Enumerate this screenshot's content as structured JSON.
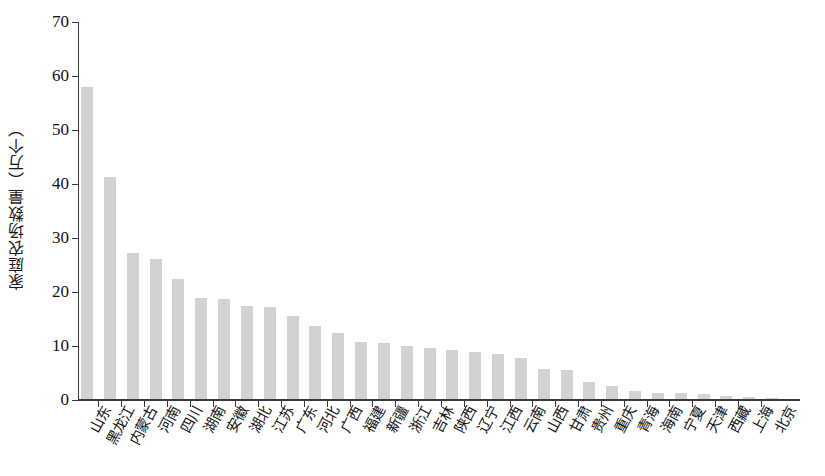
{
  "chart_data": {
    "type": "bar",
    "title": "",
    "xlabel": "",
    "ylabel": "家庭农场数量（万个）",
    "ylim": [
      0,
      70
    ],
    "ytick_step": 10,
    "ytick_labels": [
      "0",
      "10",
      "20",
      "30",
      "40",
      "50",
      "60",
      "70"
    ],
    "grid": false,
    "legend": null,
    "bar_color": "#d2d2d2",
    "axis_color": "#3a3a3a",
    "categories": [
      "山东",
      "黑龙江",
      "内蒙古",
      "河南",
      "四川",
      "湖南",
      "安徽",
      "湖北",
      "江苏",
      "广东",
      "河北",
      "广西",
      "福建",
      "新疆",
      "浙江",
      "吉林",
      "陕西",
      "辽宁",
      "江西",
      "云南",
      "山西",
      "甘肃",
      "贵州",
      "重庆",
      "青海",
      "海南",
      "宁夏",
      "天津",
      "西藏",
      "上海",
      "北京"
    ],
    "values": [
      57.7,
      41.2,
      27.1,
      25.9,
      22.3,
      18.7,
      18.6,
      17.3,
      17.0,
      15.3,
      13.6,
      12.2,
      10.6,
      10.3,
      9.8,
      9.5,
      9.0,
      8.7,
      8.4,
      7.6,
      5.5,
      5.4,
      3.2,
      2.4,
      1.5,
      1.2,
      1.1,
      1.0,
      0.6,
      0.3,
      0.2
    ]
  }
}
